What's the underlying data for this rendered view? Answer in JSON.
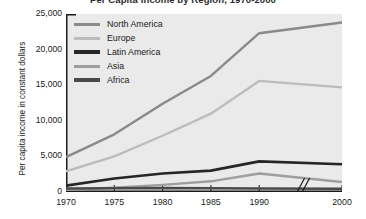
{
  "chart_data": {
    "type": "line",
    "title": "Per Capita Income by Region, 1970-2000",
    "xlabel": "",
    "ylabel": "Per capita income in constant dollars",
    "x": [
      1970,
      1975,
      1980,
      1985,
      1990,
      2000
    ],
    "xticklabels": [
      "1970",
      "1975",
      "1980",
      "1985",
      "1990",
      "2000"
    ],
    "yticklabels": [
      "0",
      "5,000",
      "10,000",
      "15,000",
      "20,000",
      "25,000"
    ],
    "yticks": [
      0,
      5000,
      10000,
      15000,
      20000,
      25000
    ],
    "ylim": [
      0,
      25000
    ],
    "grid": false,
    "legend_position": "upper-left-inside",
    "axis_break": {
      "axis": "x",
      "between": [
        1990,
        2000
      ],
      "symbol": "double-slash"
    },
    "series": [
      {
        "name": "North America",
        "color": "#8a8a8a",
        "values": [
          4900,
          8100,
          12400,
          16300,
          22300,
          23800
        ]
      },
      {
        "name": "Europe",
        "color": "#bcbcbc",
        "values": [
          2900,
          5000,
          7900,
          11000,
          15600,
          14700
        ]
      },
      {
        "name": "Latin America",
        "color": "#262626",
        "values": [
          900,
          1900,
          2600,
          3000,
          4300,
          3900
        ]
      },
      {
        "name": "Asia",
        "color": "#9e9e9e",
        "values": [
          300,
          600,
          1000,
          1500,
          2600,
          1400
        ]
      },
      {
        "name": "Africa",
        "color": "#4a4a4a",
        "values": [
          500,
          520,
          540,
          520,
          500,
          460
        ]
      }
    ]
  }
}
